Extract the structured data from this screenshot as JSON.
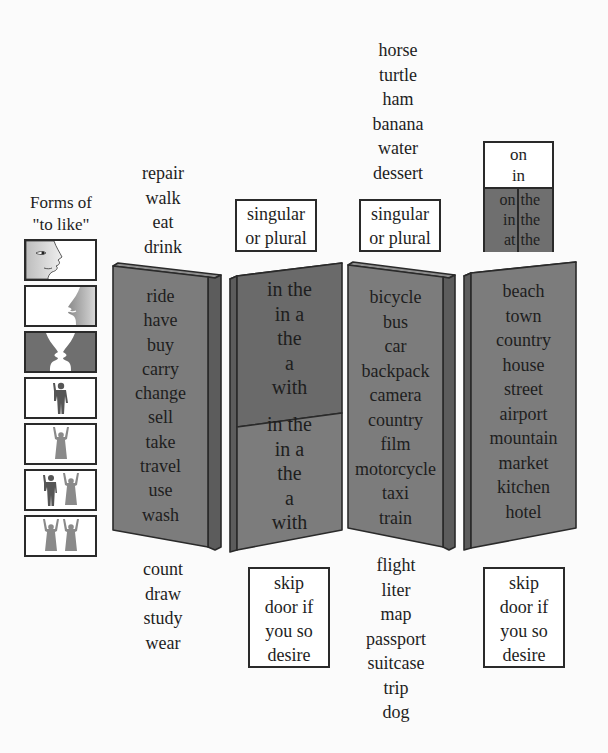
{
  "title": {
    "line1": "Forms of",
    "line2": "\"to like\""
  },
  "like_forms": [
    {
      "icon": "single-face-left-icon"
    },
    {
      "icon": "single-face-right-icon"
    },
    {
      "icon": "two-faces-facing-icon"
    },
    {
      "icon": "man-figure-icon"
    },
    {
      "icon": "woman-figure-icon"
    },
    {
      "icon": "man-and-woman-figures-icon"
    },
    {
      "icon": "two-women-figures-icon"
    }
  ],
  "verbs": {
    "above": [
      "repair",
      "walk",
      "eat",
      "drink"
    ],
    "panel": [
      "ride",
      "have",
      "buy",
      "carry",
      "change",
      "sell",
      "take",
      "travel",
      "use",
      "wash"
    ],
    "below": [
      "count",
      "draw",
      "study",
      "wear"
    ]
  },
  "articles": {
    "label_top": {
      "line1": "singular",
      "line2": "or plural"
    },
    "panel_top": [
      "in the",
      "in a",
      "the",
      "a",
      "with"
    ],
    "panel_bottom": [
      "in the",
      "in a",
      "the",
      "a",
      "with"
    ],
    "label_bottom": {
      "line1": "skip",
      "line2": "door if",
      "line3": "you so",
      "line4": "desire"
    }
  },
  "nouns": {
    "above": [
      "horse",
      "turtle",
      "ham",
      "banana",
      "water",
      "dessert"
    ],
    "label_top": {
      "line1": "singular",
      "line2": "or plural"
    },
    "panel": [
      "bicycle",
      "bus",
      "car",
      "backpack",
      "camera",
      "country",
      "film",
      "motorcycle",
      "taxi",
      "train"
    ],
    "below": [
      "flight",
      "liter",
      "map",
      "passport",
      "suitcase",
      "trip",
      "dog"
    ]
  },
  "places": {
    "prepositions": {
      "top": [
        "on",
        "in"
      ],
      "bottom_left": [
        "on",
        "in",
        "at"
      ],
      "bottom_right": [
        "the",
        "the",
        "the"
      ]
    },
    "panel": [
      "beach",
      "town",
      "country",
      "house",
      "street",
      "airport",
      "mountain",
      "market",
      "kitchen",
      "hotel"
    ],
    "label_bottom": {
      "line1": "skip",
      "line2": "door if",
      "line3": "you so",
      "line4": "desire"
    }
  },
  "colors": {
    "panel_face": "#7c7c7c",
    "panel_face_dark": "#6a6a6a",
    "panel_edge": "#5c5c5c",
    "outline": "#2a2a2a",
    "background": "#fbfbfb"
  }
}
